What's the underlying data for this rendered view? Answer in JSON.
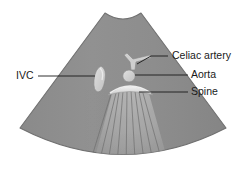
{
  "figure": {
    "modality": "ultrasound-sector-scan",
    "background_color": "#ffffff"
  },
  "sector": {
    "name": "ultrasound-sector-fan",
    "fill_color": "#8e8e8e",
    "edge_color": "#6f6f6f",
    "apex_notch": "concave-transducer-footprint",
    "apex_left_x": 105,
    "apex_right_x": 141,
    "apex_y": 13,
    "left_corner_x": 20,
    "left_corner_y": 128,
    "right_corner_x": 226,
    "right_corner_y": 128,
    "bottom_arc_low_y": 163
  },
  "structures": [
    {
      "id": "celiac-artery",
      "label": "Celiac artery",
      "shape": "seagull-branching-trunk",
      "fill_color": "#cfcfcf",
      "center_x": 133,
      "center_y": 62
    },
    {
      "id": "ivc",
      "label": "IVC",
      "shape": "elongated-oval",
      "fill_color": "#d4d4d4",
      "center_x": 100,
      "center_y": 80
    },
    {
      "id": "aorta",
      "label": "Aorta",
      "shape": "round-vessel",
      "fill_color": "#cacaca",
      "center_x": 129,
      "center_y": 76
    },
    {
      "id": "spine",
      "label": "Spine",
      "shape": "bright-convex-arc-with-acoustic-shadow",
      "fill_color": "#e2e2e2",
      "center_x": 130,
      "center_y": 90
    }
  ],
  "labels": {
    "celiac_artery": {
      "text": "Celiac artery",
      "x": 172,
      "y": 56,
      "anchor": "start",
      "leader": "M 168 56 L 151 56 L 137 64"
    },
    "aorta": {
      "text": "Aorta",
      "x": 191,
      "y": 75,
      "anchor": "start",
      "leader": "M 188 75 L 135 75"
    },
    "spine": {
      "text": "Spine",
      "x": 191,
      "y": 92,
      "anchor": "start",
      "leader": "M 188 92 L 139 92"
    },
    "ivc": {
      "text": "IVC",
      "x": 16,
      "y": 76,
      "anchor": "start",
      "leader": "M 38 76 L 95 76"
    }
  },
  "acoustic_shadow": {
    "name": "posterior-acoustic-shadow",
    "fill_color": "#a8a8a8",
    "ray_color": "#6b6b6b",
    "ray_count": 9,
    "origin_x": 130,
    "origin_y": 92
  }
}
